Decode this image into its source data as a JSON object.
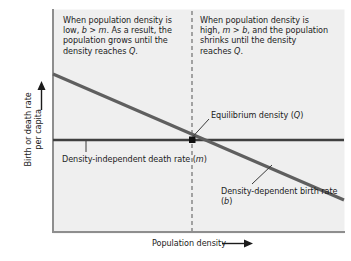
{
  "figure": {
    "type": "density-dependent-population-growth-diagram",
    "background_color": "#ffffff",
    "plot_background_color": "#efefef"
  },
  "annotations": {
    "left_text": "When population density is low, b > m. As a result, the population grows until the density reaches Q.",
    "right_text": "When population density is high, m > b, and the population shrinks until the density reaches Q.",
    "equilibrium_label": "Equilibrium density (Q)",
    "death_rate_label": "Density-independent death rate (m)",
    "birth_rate_label": "Density-dependent birth rate (b)"
  },
  "axes": {
    "x_label": "Population density",
    "y_label_line1": "Birth or death rate",
    "y_label_line2": "per capita",
    "x_arrow": "right-arrow",
    "y_arrow": "up-arrow"
  },
  "chart_data": {
    "type": "line",
    "title": "",
    "xlabel": "Population density",
    "ylabel": "Birth or death rate per capita",
    "xlim": [
      0,
      1
    ],
    "ylim": [
      0,
      1
    ],
    "grid": false,
    "legend": "none",
    "series": [
      {
        "name": "Density-dependent birth rate (b)",
        "style": "solid",
        "color": "#5a5a5a",
        "x": [
          0,
          1
        ],
        "y": [
          0.84,
          0.11
        ]
      },
      {
        "name": "Density-independent death rate (m)",
        "style": "solid",
        "color": "#3a3a3a",
        "x": [
          0,
          1
        ],
        "y": [
          0.5,
          0.5
        ]
      },
      {
        "name": "Equilibrium density (Q)",
        "style": "dashed-vertical",
        "color": "#6e6e6e",
        "x": [
          0.48,
          0.48
        ],
        "y": [
          0,
          1
        ]
      }
    ],
    "points": [
      {
        "name": "equilibrium-point",
        "x": 0.48,
        "y": 0.5,
        "marker": "square",
        "color": "#111111"
      }
    ]
  }
}
